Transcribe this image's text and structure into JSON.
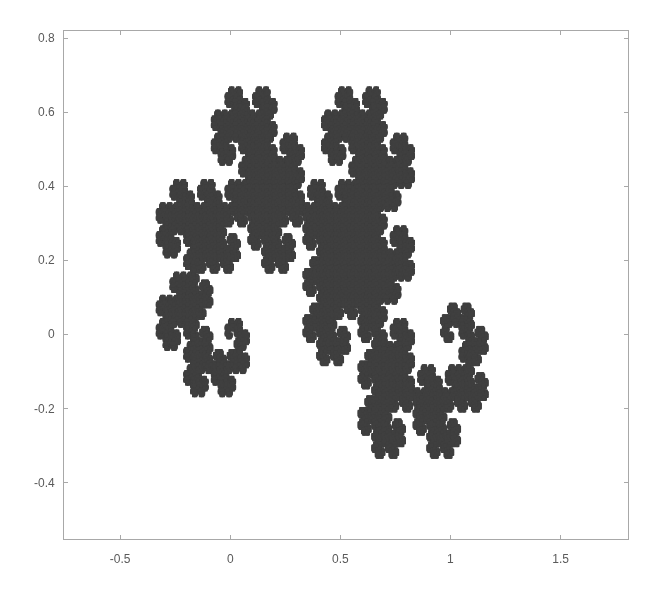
{
  "chart_data": {
    "type": "scatter",
    "title": "",
    "xlabel": "",
    "ylabel": "",
    "series": [
      {
        "name": "dragon",
        "color": "#3f3f3f",
        "ifs": [
          {
            "a": 0.5,
            "b": -0.5,
            "c": 0.5,
            "d": 0.5,
            "e": 0,
            "f": 0
          },
          {
            "a": -0.5,
            "b": -0.5,
            "c": 0.5,
            "d": -0.5,
            "e": 1,
            "f": 0
          }
        ],
        "extent": {
          "xmin": -0.3333,
          "xmax": 1.1667,
          "ymin": -0.3333,
          "ymax": 0.6667
        }
      }
    ],
    "xlim": [
      -0.76,
      1.81
    ],
    "ylim": [
      -0.555,
      0.822
    ],
    "xticks": [
      -0.5,
      0,
      0.5,
      1,
      1.5
    ],
    "xtick_labels": [
      "-0.5",
      "0",
      "0.5",
      "1",
      "1.5"
    ],
    "yticks": [
      0.8,
      0.6,
      0.4,
      0.2,
      0,
      -0.2,
      -0.4
    ],
    "ytick_labels": [
      "0.8",
      "0.6",
      "0.4",
      "0.2",
      "0",
      "-0.2",
      "-0.4"
    ],
    "grid": false,
    "legend": null
  },
  "layout": {
    "axes": {
      "left": 63,
      "top": 30,
      "right": 629,
      "bottom": 540
    },
    "colors": {
      "axis": "#a8a8a8",
      "tick_text": "#5a5a5a",
      "fill": "#3f3f3f",
      "background": "#ffffff"
    }
  }
}
